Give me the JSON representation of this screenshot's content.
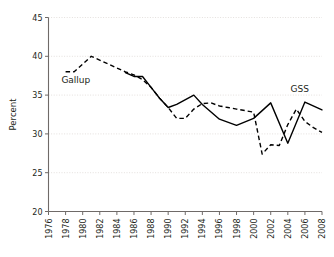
{
  "chart_data": {
    "type": "line",
    "title": "",
    "xlabel": "",
    "ylabel": "Percent",
    "xlim": [
      1976,
      2008
    ],
    "ylim": [
      20,
      45
    ],
    "yticks": [
      20,
      25,
      30,
      35,
      40,
      45
    ],
    "ytick_labels": [
      "20",
      "25",
      "30",
      "35",
      "40",
      "45"
    ],
    "xticks": [
      1976,
      1978,
      1980,
      1982,
      1984,
      1986,
      1988,
      1990,
      1992,
      1994,
      1996,
      1998,
      2000,
      2002,
      2004,
      2006,
      2008
    ],
    "xtick_labels": [
      "1976",
      "1978",
      "1980",
      "1982",
      "1984",
      "1986",
      "1988",
      "1990",
      "1992",
      "1994",
      "1996",
      "1998",
      "2000",
      "2002",
      "2004",
      "2006",
      "2008"
    ],
    "grid": "horizontal-dotted",
    "legend_position": "inline-annotation",
    "series": [
      {
        "name": "Gallup",
        "style": "dashed",
        "color": "#000000",
        "label_text": "Gallup",
        "x": [
          1978,
          1979,
          1981,
          1983,
          1985,
          1986,
          1987,
          1988,
          1989,
          1990,
          1991,
          1992,
          1993,
          1994,
          1995,
          1996,
          1997,
          1998,
          1999,
          2000,
          2001,
          2002,
          2003,
          2004,
          2005,
          2006,
          2007,
          2008
        ],
        "values": [
          38.0,
          38.0,
          40.0,
          39.0,
          38.0,
          37.6,
          37.0,
          36.0,
          34.6,
          33.4,
          32.0,
          32.0,
          33.2,
          33.9,
          34.0,
          33.6,
          33.4,
          33.2,
          33.0,
          32.8,
          27.4,
          28.6,
          28.5,
          31.2,
          33.2,
          31.6,
          30.8,
          30.2
        ]
      },
      {
        "name": "GSS",
        "style": "solid",
        "color": "#000000",
        "label_text": "GSS",
        "x": [
          1985,
          1986,
          1987,
          1988,
          1989,
          1990,
          1991,
          1993,
          1994,
          1996,
          1998,
          2000,
          2002,
          2004,
          2006,
          2008
        ],
        "values": [
          37.9,
          37.4,
          37.4,
          36.0,
          34.6,
          33.4,
          33.8,
          35.0,
          33.8,
          31.9,
          31.1,
          32.0,
          34.0,
          28.8,
          34.1,
          33.1
        ]
      }
    ],
    "annotations": [
      {
        "text": "Gallup",
        "x": 1979.2,
        "y": 36.6
      },
      {
        "text": "GSS",
        "x": 2005.4,
        "y": 35.4
      }
    ]
  }
}
